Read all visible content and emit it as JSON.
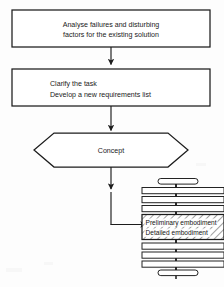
{
  "diagram": {
    "background_color": "#fdfdfd",
    "line_color": "#1c1c1c",
    "text_color": "#1a1a1a",
    "fill_color": "#ffffff",
    "nodes": [
      {
        "id": "analyse",
        "shape": "rectangle",
        "lines": [
          "Analyse failures and disturbing",
          "factors for the existing solution"
        ],
        "align": "center"
      },
      {
        "id": "clarify",
        "shape": "rectangle",
        "lines": [
          "Clarify the task",
          "Develop a new requirements list"
        ],
        "align": "left"
      },
      {
        "id": "concept",
        "shape": "hexagon",
        "lines": [
          "Concept"
        ],
        "align": "center"
      },
      {
        "id": "embodiment",
        "shape": "hatched-rectangle",
        "lines": [
          "Preliminary embodiment",
          "Detailed embodiment"
        ],
        "align": "left"
      }
    ],
    "connectors": [
      {
        "id": "analyse-to-clarify",
        "type": "arrow-down"
      },
      {
        "id": "clarify-to-concept",
        "type": "arrow-down"
      },
      {
        "id": "concept-to-embodiment",
        "type": "elbow-arrow-right"
      }
    ],
    "stack": {
      "id": "embodiment-stack",
      "description": "Stacked process bars with central spine",
      "bars_above": 4,
      "bars_below": 4
    }
  }
}
